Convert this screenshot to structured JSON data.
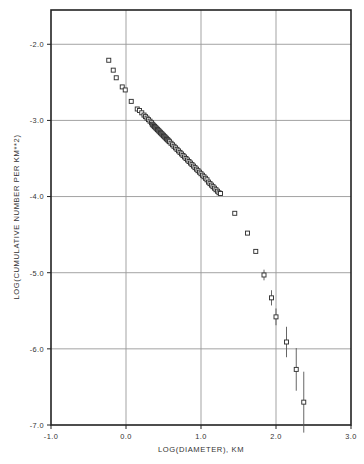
{
  "figure": {
    "xlabel": "LOG(DIAMETER), KM",
    "ylabel": "LOG(CUMULATIVE NUMBER PER KM**2)",
    "marker": "open-square",
    "line_color": "#000000",
    "grid_color": "#999999",
    "frame_color": "#222222"
  },
  "axes": {
    "x_ticks": [
      "-1.0",
      "0.0",
      "1.0",
      "2.0",
      "3.0"
    ],
    "y_ticks": [
      "-2.0",
      "-3.0",
      "-4.0",
      "-5.0",
      "-6.0",
      "-7.0"
    ]
  },
  "chart_data": {
    "type": "scatter",
    "title": "",
    "xlabel": "LOG(DIAMETER), KM",
    "ylabel": "LOG(CUMULATIVE NUMBER PER KM**2)",
    "xlim": [
      -1.0,
      3.0
    ],
    "ylim": [
      -7.0,
      -1.55
    ],
    "grid": true,
    "legend": "none",
    "marker": "open square",
    "errorbars": "vertical, increasing toward large diameters",
    "points": [
      {
        "x": -0.23,
        "y": -2.21,
        "err": 0.0
      },
      {
        "x": -0.17,
        "y": -2.34,
        "err": 0.0
      },
      {
        "x": -0.13,
        "y": -2.44,
        "err": 0.0
      },
      {
        "x": -0.05,
        "y": -2.56,
        "err": 0.0
      },
      {
        "x": -0.01,
        "y": -2.6,
        "err": 0.0
      },
      {
        "x": 0.07,
        "y": -2.75,
        "err": 0.0
      },
      {
        "x": 0.15,
        "y": -2.85,
        "err": 0.0
      },
      {
        "x": 0.18,
        "y": -2.87,
        "err": 0.0
      },
      {
        "x": 0.21,
        "y": -2.9,
        "err": 0.0
      },
      {
        "x": 0.24,
        "y": -2.93,
        "err": 0.0
      },
      {
        "x": 0.26,
        "y": -2.95,
        "err": 0.0
      },
      {
        "x": 0.28,
        "y": -2.97,
        "err": 0.0
      },
      {
        "x": 0.3,
        "y": -2.99,
        "err": 0.0
      },
      {
        "x": 0.32,
        "y": -3.01,
        "err": 0.0
      },
      {
        "x": 0.34,
        "y": -3.03,
        "err": 0.0
      },
      {
        "x": 0.35,
        "y": -3.05,
        "err": 0.0
      },
      {
        "x": 0.36,
        "y": -3.06,
        "err": 0.0
      },
      {
        "x": 0.37,
        "y": -3.07,
        "err": 0.0
      },
      {
        "x": 0.38,
        "y": -3.08,
        "err": 0.0
      },
      {
        "x": 0.39,
        "y": -3.09,
        "err": 0.0
      },
      {
        "x": 0.4,
        "y": -3.1,
        "err": 0.0
      },
      {
        "x": 0.41,
        "y": -3.11,
        "err": 0.0
      },
      {
        "x": 0.42,
        "y": -3.12,
        "err": 0.0
      },
      {
        "x": 0.43,
        "y": -3.13,
        "err": 0.0
      },
      {
        "x": 0.44,
        "y": -3.14,
        "err": 0.0
      },
      {
        "x": 0.45,
        "y": -3.15,
        "err": 0.0
      },
      {
        "x": 0.46,
        "y": -3.16,
        "err": 0.0
      },
      {
        "x": 0.47,
        "y": -3.17,
        "err": 0.0
      },
      {
        "x": 0.48,
        "y": -3.18,
        "err": 0.0
      },
      {
        "x": 0.49,
        "y": -3.19,
        "err": 0.0
      },
      {
        "x": 0.5,
        "y": -3.2,
        "err": 0.0
      },
      {
        "x": 0.51,
        "y": -3.21,
        "err": 0.0
      },
      {
        "x": 0.52,
        "y": -3.22,
        "err": 0.0
      },
      {
        "x": 0.53,
        "y": -3.23,
        "err": 0.0
      },
      {
        "x": 0.54,
        "y": -3.24,
        "err": 0.0
      },
      {
        "x": 0.55,
        "y": -3.25,
        "err": 0.0
      },
      {
        "x": 0.56,
        "y": -3.26,
        "err": 0.0
      },
      {
        "x": 0.57,
        "y": -3.27,
        "err": 0.0
      },
      {
        "x": 0.58,
        "y": -3.28,
        "err": 0.0
      },
      {
        "x": 0.6,
        "y": -3.3,
        "err": 0.0
      },
      {
        "x": 0.62,
        "y": -3.32,
        "err": 0.0
      },
      {
        "x": 0.64,
        "y": -3.34,
        "err": 0.0
      },
      {
        "x": 0.66,
        "y": -3.36,
        "err": 0.0
      },
      {
        "x": 0.68,
        "y": -3.38,
        "err": 0.0
      },
      {
        "x": 0.7,
        "y": -3.4,
        "err": 0.0
      },
      {
        "x": 0.72,
        "y": -3.42,
        "err": 0.0
      },
      {
        "x": 0.74,
        "y": -3.44,
        "err": 0.0
      },
      {
        "x": 0.76,
        "y": -3.46,
        "err": 0.0
      },
      {
        "x": 0.78,
        "y": -3.48,
        "err": 0.0
      },
      {
        "x": 0.8,
        "y": -3.5,
        "err": 0.0
      },
      {
        "x": 0.82,
        "y": -3.52,
        "err": 0.0
      },
      {
        "x": 0.84,
        "y": -3.54,
        "err": 0.0
      },
      {
        "x": 0.86,
        "y": -3.56,
        "err": 0.0
      },
      {
        "x": 0.88,
        "y": -3.58,
        "err": 0.0
      },
      {
        "x": 0.9,
        "y": -3.6,
        "err": 0.0
      },
      {
        "x": 0.92,
        "y": -3.62,
        "err": 0.0
      },
      {
        "x": 0.94,
        "y": -3.64,
        "err": 0.0
      },
      {
        "x": 0.96,
        "y": -3.66,
        "err": 0.0
      },
      {
        "x": 0.98,
        "y": -3.68,
        "err": 0.0
      },
      {
        "x": 1.0,
        "y": -3.7,
        "err": 0.0
      },
      {
        "x": 1.02,
        "y": -3.72,
        "err": 0.0
      },
      {
        "x": 1.04,
        "y": -3.74,
        "err": 0.0
      },
      {
        "x": 1.06,
        "y": -3.76,
        "err": 0.0
      },
      {
        "x": 1.08,
        "y": -3.78,
        "err": 0.0
      },
      {
        "x": 1.1,
        "y": -3.81,
        "err": 0.0
      },
      {
        "x": 1.12,
        "y": -3.83,
        "err": 0.0
      },
      {
        "x": 1.14,
        "y": -3.85,
        "err": 0.0
      },
      {
        "x": 1.16,
        "y": -3.87,
        "err": 0.0
      },
      {
        "x": 1.18,
        "y": -3.89,
        "err": 0.0
      },
      {
        "x": 1.2,
        "y": -3.91,
        "err": 0.0
      },
      {
        "x": 1.22,
        "y": -3.93,
        "err": 0.0
      },
      {
        "x": 1.24,
        "y": -3.95,
        "err": 0.0
      },
      {
        "x": 1.26,
        "y": -3.96,
        "err": 0.0
      },
      {
        "x": 1.45,
        "y": -4.22,
        "err": 0.0
      },
      {
        "x": 1.62,
        "y": -4.48,
        "err": 0.0
      },
      {
        "x": 1.73,
        "y": -4.72,
        "err": 0.0
      },
      {
        "x": 1.84,
        "y": -5.03,
        "err": 0.07
      },
      {
        "x": 1.94,
        "y": -5.33,
        "err": 0.1
      },
      {
        "x": 2.0,
        "y": -5.58,
        "err": 0.11
      },
      {
        "x": 2.14,
        "y": -5.91,
        "err": 0.2
      },
      {
        "x": 2.27,
        "y": -6.27,
        "err": 0.28
      },
      {
        "x": 2.37,
        "y": -6.7,
        "err": 0.4
      }
    ]
  }
}
